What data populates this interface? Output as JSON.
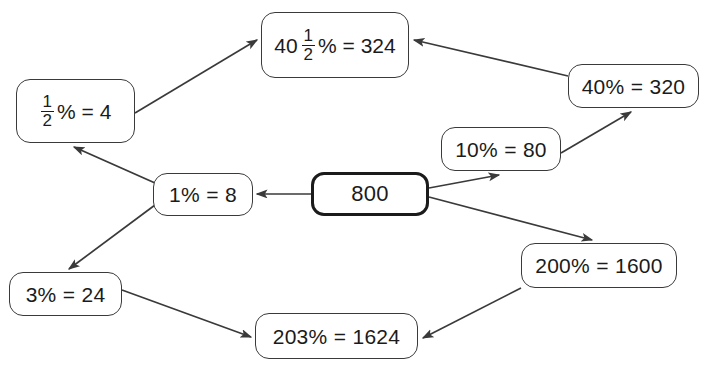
{
  "diagram": {
    "stroke_color": "#3a3a3a",
    "root_stroke_color": "#1b1b1b",
    "background_color": "#ffffff",
    "nodes": [
      {
        "id": "root",
        "name": "node-800",
        "text": "800",
        "kind": "plain",
        "x": 311,
        "y": 172,
        "w": 118,
        "h": 44
      },
      {
        "id": "one_percent",
        "name": "node-1-percent",
        "text": "1% = 8",
        "kind": "plain",
        "x": 153,
        "y": 173,
        "w": 100,
        "h": 43
      },
      {
        "id": "half_percent",
        "name": "node-half-percent",
        "kind": "fraction",
        "whole": "",
        "numerator": "1",
        "denominator": "2",
        "tail": "% = 4",
        "text": "1/2% = 4",
        "x": 16,
        "y": 79,
        "w": 119,
        "h": 64
      },
      {
        "id": "forty_half_percent",
        "name": "node-40-and-half-percent",
        "kind": "fraction",
        "whole": "40",
        "numerator": "1",
        "denominator": "2",
        "tail": "% = 324",
        "text": "40 1/2% = 324",
        "x": 261,
        "y": 12,
        "w": 148,
        "h": 66
      },
      {
        "id": "forty_percent",
        "name": "node-40-percent",
        "text": "40% = 320",
        "kind": "plain",
        "x": 568,
        "y": 64,
        "w": 131,
        "h": 44
      },
      {
        "id": "ten_percent",
        "name": "node-10-percent",
        "text": "10% = 80",
        "kind": "plain",
        "x": 441,
        "y": 127,
        "w": 120,
        "h": 44
      },
      {
        "id": "two_hundred_percent",
        "name": "node-200-percent",
        "text": "200% = 1600",
        "kind": "plain",
        "x": 521,
        "y": 243,
        "w": 156,
        "h": 45
      },
      {
        "id": "three_percent",
        "name": "node-3-percent",
        "text": "3% = 24",
        "kind": "plain",
        "x": 9,
        "y": 272,
        "w": 113,
        "h": 44
      },
      {
        "id": "two_oh_three_percent",
        "name": "node-203-percent",
        "text": "203% = 1624",
        "kind": "plain",
        "x": 255,
        "y": 313,
        "w": 163,
        "h": 46
      }
    ],
    "edges": [
      {
        "name": "edge-800-to-1-percent",
        "from": "root",
        "to": "one_percent",
        "x1": 311,
        "y1": 194,
        "x2": 257,
        "y2": 194
      },
      {
        "name": "edge-800-to-10-percent",
        "from": "root",
        "to": "ten_percent",
        "x1": 429,
        "y1": 188,
        "x2": 499,
        "y2": 175
      },
      {
        "name": "edge-800-to-200-percent",
        "from": "root",
        "to": "two_hundred_percent",
        "x1": 429,
        "y1": 197,
        "x2": 592,
        "y2": 240
      },
      {
        "name": "edge-1-percent-to-half-percent",
        "from": "one_percent",
        "to": "half_percent",
        "x1": 155,
        "y1": 183,
        "x2": 74,
        "y2": 147
      },
      {
        "name": "edge-1-percent-to-3-percent",
        "from": "one_percent",
        "to": "three_percent",
        "x1": 155,
        "y1": 205,
        "x2": 69,
        "y2": 269
      },
      {
        "name": "edge-half-percent-to-40-half-percent",
        "from": "half_percent",
        "to": "forty_half_percent",
        "x1": 135,
        "y1": 113,
        "x2": 257,
        "y2": 40
      },
      {
        "name": "edge-10-percent-to-40-percent",
        "from": "ten_percent",
        "to": "forty_percent",
        "x1": 561,
        "y1": 153,
        "x2": 631,
        "y2": 112
      },
      {
        "name": "edge-40-percent-to-40-half-percent",
        "from": "forty_percent",
        "to": "forty_half_percent",
        "x1": 568,
        "y1": 76,
        "x2": 414,
        "y2": 40
      },
      {
        "name": "edge-3-percent-to-203-percent",
        "from": "three_percent",
        "to": "two_oh_three_percent",
        "x1": 122,
        "y1": 290,
        "x2": 251,
        "y2": 337
      },
      {
        "name": "edge-200-percent-to-203-percent",
        "from": "two_hundred_percent",
        "to": "two_oh_three_percent",
        "x1": 521,
        "y1": 288,
        "x2": 423,
        "y2": 338
      }
    ]
  }
}
